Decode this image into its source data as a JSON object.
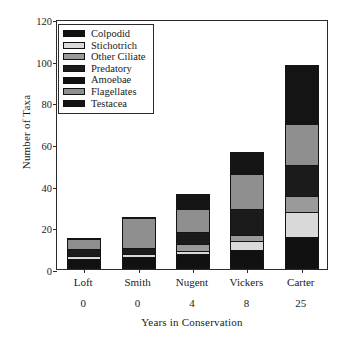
{
  "chart_data": {
    "type": "bar",
    "subtype": "stacked-bar",
    "title": "",
    "xlabel": "Years in Conservation",
    "ylabel": "Number of Taxa",
    "ylim": [
      0,
      120
    ],
    "yticks": [
      0,
      20,
      40,
      60,
      80,
      100,
      120
    ],
    "grid": false,
    "legend_position": "top-left-inside",
    "categories": [
      "Loft",
      "Smith",
      "Nugent",
      "Vickers",
      "Carter"
    ],
    "category_years": [
      "0",
      "0",
      "4",
      "8",
      "25"
    ],
    "totals": [
      15,
      25,
      36,
      56,
      98
    ],
    "series": [
      {
        "name": "Colpodid",
        "color": "#111111",
        "values": [
          4.5,
          5.5,
          7.0,
          9.0,
          15.0
        ]
      },
      {
        "name": "Stichotrich",
        "color": "#d9d9d9",
        "values": [
          1.5,
          1.5,
          1.5,
          4.0,
          12.0
        ]
      },
      {
        "name": "Other Ciliate",
        "color": "#9a9a9a",
        "values": [
          0.0,
          0.0,
          3.5,
          3.0,
          8.0
        ]
      },
      {
        "name": "Predatory",
        "color": "#1b1b1b",
        "values": [
          3.5,
          3.0,
          5.5,
          13.0,
          15.0
        ]
      },
      {
        "name": "Amoebae",
        "color": "#111111",
        "values": [
          0.0,
          0.0,
          0.0,
          0.0,
          0.0
        ]
      },
      {
        "name": "Flagellates",
        "color": "#8f8f8f",
        "values": [
          5.5,
          15.0,
          11.5,
          17.0,
          20.0
        ]
      },
      {
        "name": "Testacea",
        "color": "#141414",
        "values": [
          0.0,
          0.0,
          7.0,
          10.0,
          28.0
        ]
      }
    ]
  },
  "legend": {
    "items": [
      {
        "label": "Colpodid"
      },
      {
        "label": "Stichotrich"
      },
      {
        "label": "Other Ciliate"
      },
      {
        "label": "Predatory"
      },
      {
        "label": "Amoebae"
      },
      {
        "label": "Flagellates"
      },
      {
        "label": "Testacea"
      }
    ]
  }
}
